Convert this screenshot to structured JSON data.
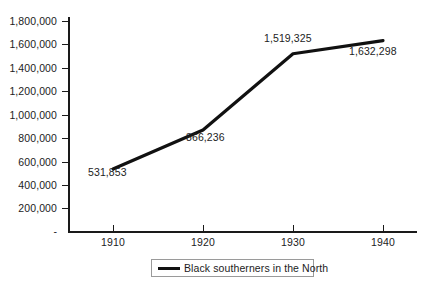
{
  "chart_data": {
    "type": "line",
    "title": "",
    "subtitle": "",
    "xlabel": "",
    "ylabel": "",
    "categories": [
      "1910",
      "1920",
      "1930",
      "1940"
    ],
    "x": [
      1910,
      1920,
      1930,
      1940
    ],
    "values": [
      531853,
      866236,
      1519325,
      1632298
    ],
    "series": [
      {
        "name": "Black southerners in the North",
        "color": "#111111",
        "values": [
          531853,
          866236,
          1519325,
          1632298
        ]
      }
    ],
    "point_labels": [
      "531,853",
      "866,236",
      "1,519,325",
      "1,632,298"
    ],
    "ylim": [
      0,
      1800000
    ],
    "ytick_values": [
      0,
      200000,
      400000,
      600000,
      800000,
      1000000,
      1200000,
      1400000,
      1600000,
      1800000
    ],
    "ytick_labels": [
      "-",
      "200,000",
      "400,000",
      "600,000",
      "800,000",
      "1,000,000",
      "1,200,000",
      "1,400,000",
      "1,600,000",
      "1,800,000"
    ],
    "xtick_labels": [
      "1910",
      "1920",
      "1930",
      "1940"
    ],
    "grid": false,
    "legend_position": "bottom-center"
  },
  "legend": {
    "entries": [
      {
        "label": "Black southerners in the North",
        "color": "#111111"
      }
    ]
  },
  "axis": {
    "y": {
      "t1800000": "1,800,000",
      "t1600000": "1,600,000",
      "t1400000": "1,400,000",
      "t1200000": "1,200,000",
      "t1000000": "1,000,000",
      "t800000": "800,000",
      "t600000": "600,000",
      "t400000": "400,000",
      "t200000": "200,000",
      "t0": "-"
    },
    "x": {
      "t1910": "1910",
      "t1920": "1920",
      "t1930": "1930",
      "t1940": "1940"
    }
  },
  "labels": {
    "p1910": "531,853",
    "p1920": "866,236",
    "p1930": "1,519,325",
    "p1940": "1,632,298"
  }
}
